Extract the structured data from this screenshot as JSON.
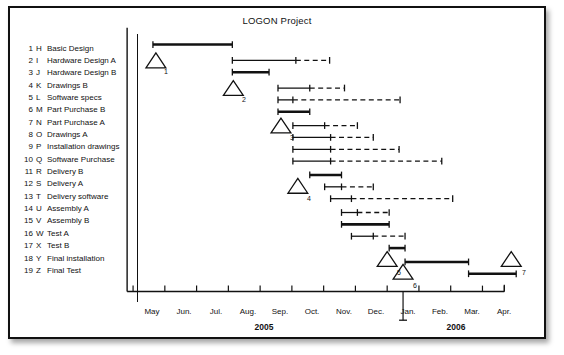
{
  "chart_title": "LOGON Project",
  "tasks": [
    {
      "num": "1",
      "code": "H",
      "name": "Basic Design"
    },
    {
      "num": "2",
      "code": "I",
      "name": "Hardware Design A"
    },
    {
      "num": "3",
      "code": "J",
      "name": "Hardware Design B"
    },
    {
      "num": "4",
      "code": "K",
      "name": "Drawings B"
    },
    {
      "num": "5",
      "code": "L",
      "name": "Software  specs"
    },
    {
      "num": "6",
      "code": "M",
      "name": "Part Purchase B"
    },
    {
      "num": "7",
      "code": "N",
      "name": "Part Purchase A"
    },
    {
      "num": "8",
      "code": "O",
      "name": "Drawings A"
    },
    {
      "num": "9",
      "code": "P",
      "name": "Installation drawings"
    },
    {
      "num": "10",
      "code": "Q",
      "name": "Software Purchase"
    },
    {
      "num": "11",
      "code": "R",
      "name": "Delivery B"
    },
    {
      "num": "12",
      "code": "S",
      "name": "Delivery A"
    },
    {
      "num": "13",
      "code": "T",
      "name": "Delivery software"
    },
    {
      "num": "14",
      "code": "U",
      "name": "Assembly  A"
    },
    {
      "num": "15",
      "code": "V",
      "name": "Assembly  B"
    },
    {
      "num": "16",
      "code": "W",
      "name": "Test A"
    },
    {
      "num": "17",
      "code": "X",
      "name": "Test B"
    },
    {
      "num": "18",
      "code": "Y",
      "name": "Final installation"
    },
    {
      "num": "19",
      "code": "Z",
      "name": "Final Test"
    }
  ],
  "axis": {
    "months": [
      "May",
      "Jun.",
      "Jul.",
      "Aug.",
      "Sep.",
      "Oct.",
      "Nov.",
      "Dec.",
      "Jan.",
      "Feb.",
      "Mar.",
      "Apr."
    ],
    "years": [
      {
        "label": "2005",
        "center_month_index": 3.5
      },
      {
        "label": "2006",
        "center_month_index": 9.5
      }
    ],
    "start_px": 132,
    "month_px": 32,
    "baseline_y": 293
  },
  "milestones": [
    {
      "label": "1",
      "x": 155,
      "y": 59
    },
    {
      "label": "2",
      "x": 233,
      "y": 87
    },
    {
      "label": "3",
      "x": 281,
      "y": 125
    },
    {
      "label": "4",
      "x": 298,
      "y": 186
    },
    {
      "label": "5",
      "x": 388,
      "y": 260
    },
    {
      "label": "6",
      "x": 404,
      "y": 273
    },
    {
      "label": "7",
      "x": 513,
      "y": 260
    }
  ],
  "today_marker": {
    "x": 404,
    "y_top": 293,
    "y_bottom": 322
  },
  "chart_data": {
    "type": "bar",
    "subtype": "gantt",
    "title": "LOGON Project",
    "xlabel": "",
    "ylabel": "",
    "grid": false,
    "legend": "none",
    "x_unit": "month",
    "x_ticks": [
      "May",
      "Jun.",
      "Jul.",
      "Aug.",
      "Sep.",
      "Oct.",
      "Nov.",
      "Dec.",
      "Jan.",
      "Feb.",
      "Mar.",
      "Apr."
    ],
    "x_range_years": [
      "2005",
      "2006"
    ],
    "categories": [
      "H Basic Design",
      "I Hardware Design A",
      "J Hardware Design B",
      "K Drawings B",
      "L Software specs",
      "M Part Purchase B",
      "N Part Purchase A",
      "O Drawings A",
      "P Installation drawings",
      "Q Software Purchase",
      "R Delivery B",
      "S Delivery A",
      "T Delivery software",
      "U Assembly A",
      "V Assembly B",
      "W Test A",
      "X Test B",
      "Y Final installation",
      "Z Final Test"
    ],
    "bars": [
      {
        "row": 1,
        "code": "H",
        "start_px": 152,
        "solid_end_px": 232,
        "float_end_px": 232,
        "weight": "thick",
        "y": 43
      },
      {
        "row": 2,
        "code": "I",
        "start_px": 232,
        "solid_end_px": 296,
        "float_end_px": 330,
        "weight": "thin",
        "y": 59
      },
      {
        "row": 3,
        "code": "J",
        "start_px": 232,
        "solid_end_px": 269,
        "float_end_px": 269,
        "weight": "thick",
        "y": 71
      },
      {
        "row": 4,
        "code": "K",
        "start_px": 278,
        "solid_end_px": 310,
        "float_end_px": 345,
        "weight": "thin",
        "y": 87
      },
      {
        "row": 5,
        "code": "L",
        "start_px": 278,
        "solid_end_px": 293,
        "float_end_px": 401,
        "weight": "thin",
        "y": 99
      },
      {
        "row": 6,
        "code": "M",
        "start_px": 278,
        "solid_end_px": 310,
        "float_end_px": 310,
        "weight": "thick",
        "y": 111
      },
      {
        "row": 7,
        "code": "N",
        "start_px": 293,
        "solid_end_px": 325,
        "float_end_px": 358,
        "weight": "thin",
        "y": 125
      },
      {
        "row": 8,
        "code": "O",
        "start_px": 293,
        "solid_end_px": 331,
        "float_end_px": 374,
        "weight": "thin",
        "y": 137
      },
      {
        "row": 9,
        "code": "P",
        "start_px": 293,
        "solid_end_px": 331,
        "float_end_px": 400,
        "weight": "thin",
        "y": 149
      },
      {
        "row": 10,
        "code": "Q",
        "start_px": 293,
        "solid_end_px": 331,
        "float_end_px": 443,
        "weight": "thin",
        "y": 161
      },
      {
        "row": 11,
        "code": "R",
        "start_px": 310,
        "solid_end_px": 342,
        "float_end_px": 342,
        "weight": "thick",
        "y": 175
      },
      {
        "row": 12,
        "code": "S",
        "start_px": 325,
        "solid_end_px": 342,
        "float_end_px": 374,
        "weight": "thin",
        "y": 187
      },
      {
        "row": 13,
        "code": "T",
        "start_px": 331,
        "solid_end_px": 352,
        "float_end_px": 454,
        "weight": "thin",
        "y": 199
      },
      {
        "row": 14,
        "code": "U",
        "start_px": 342,
        "solid_end_px": 358,
        "float_end_px": 390,
        "weight": "thin",
        "y": 213
      },
      {
        "row": 15,
        "code": "V",
        "start_px": 342,
        "solid_end_px": 390,
        "float_end_px": 390,
        "weight": "thick",
        "y": 225
      },
      {
        "row": 16,
        "code": "W",
        "start_px": 352,
        "solid_end_px": 374,
        "float_end_px": 406,
        "weight": "thin",
        "y": 237
      },
      {
        "row": 17,
        "code": "X",
        "start_px": 390,
        "solid_end_px": 406,
        "float_end_px": 406,
        "weight": "thick",
        "y": 249
      },
      {
        "row": 18,
        "code": "Y",
        "start_px": 406,
        "solid_end_px": 470,
        "float_end_px": 470,
        "weight": "thick",
        "y": 263
      },
      {
        "row": 19,
        "code": "Z",
        "start_px": 470,
        "solid_end_px": 518,
        "float_end_px": 518,
        "weight": "thick",
        "y": 275
      }
    ]
  }
}
